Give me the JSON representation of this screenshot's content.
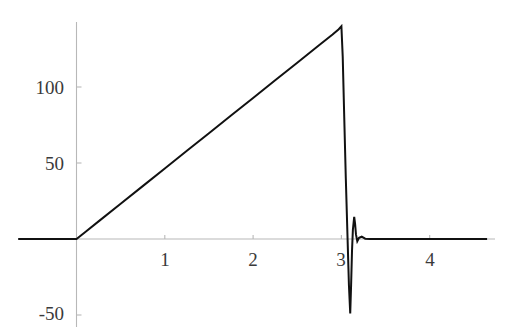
{
  "chart_data": {
    "type": "line",
    "title": "",
    "subtitle": "",
    "xlabel": "",
    "ylabel": "",
    "xlim": [
      -0.66,
      4.65
    ],
    "ylim": [
      -58,
      145
    ],
    "grid": false,
    "legend": null,
    "axis_style": {
      "spine_color": "#b4b4b4",
      "tick_color": "#b4b4b4",
      "curve_color": "#111111",
      "background": "#ffffff",
      "zero_x": 0,
      "zero_y": 0
    },
    "xticks": [
      1,
      2,
      3,
      4
    ],
    "xtick_labels": [
      "1",
      "2",
      "3",
      "4"
    ],
    "yticks": [
      -50,
      50,
      100
    ],
    "ytick_labels": [
      "-50",
      "50",
      "100"
    ],
    "series": [
      {
        "name": "f(x)",
        "color": "#111111",
        "linewidth": 2.0,
        "points": [
          [
            -0.66,
            0
          ],
          [
            -0.4,
            0
          ],
          [
            -0.2,
            0
          ],
          [
            -0.06,
            0
          ],
          [
            0.0,
            0
          ],
          [
            0.1,
            4.6
          ],
          [
            0.25,
            11.6
          ],
          [
            0.5,
            23.2
          ],
          [
            0.75,
            34.8
          ],
          [
            1.0,
            46.4
          ],
          [
            1.25,
            58.0
          ],
          [
            1.5,
            69.6
          ],
          [
            1.75,
            81.2
          ],
          [
            2.0,
            92.8
          ],
          [
            2.25,
            104.4
          ],
          [
            2.5,
            116.0
          ],
          [
            2.75,
            127.6
          ],
          [
            2.9,
            134.5
          ],
          [
            2.97,
            138.0
          ],
          [
            3.0,
            140.0
          ],
          [
            3.015,
            120.0
          ],
          [
            3.03,
            85.0
          ],
          [
            3.05,
            40.0
          ],
          [
            3.07,
            0.0
          ],
          [
            3.085,
            -30.0
          ],
          [
            3.1,
            -49.0
          ],
          [
            3.11,
            -30.0
          ],
          [
            3.12,
            -8.0
          ],
          [
            3.13,
            6.0
          ],
          [
            3.145,
            14.5
          ],
          [
            3.155,
            10.0
          ],
          [
            3.165,
            3.0
          ],
          [
            3.18,
            -1.5
          ],
          [
            3.2,
            0.8
          ],
          [
            3.23,
            1.5
          ],
          [
            3.27,
            0.2
          ],
          [
            3.32,
            0.0
          ],
          [
            3.5,
            0.0
          ],
          [
            3.8,
            0.0
          ],
          [
            4.1,
            0.0
          ],
          [
            4.4,
            0.0
          ],
          [
            4.65,
            0.0
          ]
        ],
        "peak": {
          "x": 3.0,
          "y": 140
        },
        "trough": {
          "x": 3.1,
          "y": -49
        }
      }
    ]
  },
  "ticks": {
    "y": [
      {
        "value": 100,
        "label": "100"
      },
      {
        "value": 50,
        "label": "50"
      },
      {
        "value": -50,
        "label": "-50"
      }
    ],
    "x": [
      {
        "value": 1,
        "label": "1"
      },
      {
        "value": 2,
        "label": "2"
      },
      {
        "value": 3,
        "label": "3"
      },
      {
        "value": 4,
        "label": "4"
      }
    ]
  },
  "labels": {
    "y_100": "100",
    "y_50": "50",
    "y_neg50": "-50",
    "x_1": "1",
    "x_2": "2",
    "x_3": "3",
    "x_4": "4"
  }
}
